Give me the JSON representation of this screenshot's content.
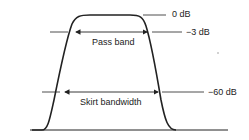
{
  "diagram": {
    "levels": [
      {
        "id": "zero",
        "label": "0 dB"
      },
      {
        "id": "minus3",
        "label": "−3 dB"
      },
      {
        "id": "minus60",
        "label": "−60 dB"
      }
    ],
    "spans": {
      "pass_band": "Pass band",
      "skirt_bandwidth": "Skirt bandwidth"
    },
    "colors": {
      "line": "#222222",
      "background": "#ffffff"
    }
  }
}
